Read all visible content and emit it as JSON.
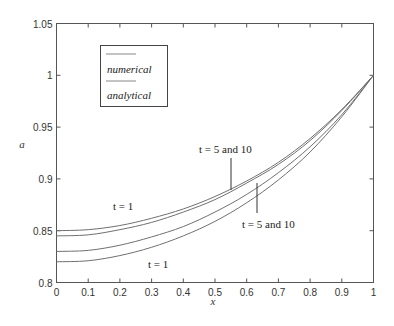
{
  "chart_data": {
    "type": "line",
    "title": "",
    "xlabel": "x",
    "ylabel": "a",
    "xlim": [
      0,
      1
    ],
    "ylim": [
      0.8,
      1.05
    ],
    "grid": false,
    "legend_position": "upper-left (inside)",
    "x_ticks": [
      "0",
      "0.1",
      "0.2",
      "0.3",
      "0.4",
      "0.5",
      "0.6",
      "0.7",
      "0.8",
      "0.9",
      "1"
    ],
    "y_ticks": [
      "0.8",
      "0.85",
      "0.9",
      "0.95",
      "1",
      "1.05"
    ],
    "legend": [
      {
        "label": "numerical"
      },
      {
        "label": "analytical"
      }
    ],
    "x": [
      0,
      0.1,
      0.2,
      0.3,
      0.4,
      0.5,
      0.6,
      0.7,
      0.8,
      0.9,
      1.0
    ],
    "series": [
      {
        "name": "t = 1 (upper)",
        "values": [
          0.85,
          0.851,
          0.855,
          0.862,
          0.871,
          0.883,
          0.898,
          0.916,
          0.939,
          0.967,
          1.0
        ]
      },
      {
        "name": "t = 5 and 10 (upper)",
        "values": [
          0.845,
          0.846,
          0.851,
          0.858,
          0.868,
          0.88,
          0.896,
          0.914,
          0.937,
          0.966,
          1.0
        ]
      },
      {
        "name": "t = 5 and 10 (lower)",
        "values": [
          0.83,
          0.831,
          0.836,
          0.844,
          0.854,
          0.868,
          0.885,
          0.906,
          0.931,
          0.962,
          1.0
        ]
      },
      {
        "name": "t = 1 (lower)",
        "values": [
          0.82,
          0.821,
          0.826,
          0.834,
          0.845,
          0.859,
          0.877,
          0.899,
          0.926,
          0.96,
          1.0
        ]
      }
    ],
    "annotations": [
      {
        "text": "t = 1",
        "near": "upper curve, x≈0.2"
      },
      {
        "text": "t = 5 and 10",
        "near": "upper pair, x≈0.55, pointer line"
      },
      {
        "text": "t = 5 and 10",
        "near": "lower pair, x≈0.63, pointer line"
      },
      {
        "text": "t = 1",
        "near": "lower curve, x≈0.3"
      }
    ]
  },
  "labels": {
    "xlabel": "x",
    "ylabel": "a",
    "legend_numerical": "numerical",
    "legend_analytical": "analytical",
    "annot_t1_upper": "t = 1",
    "annot_t510_upper": "t = 5 and 10",
    "annot_t510_lower": "t = 5 and 10",
    "annot_t1_lower": "t = 1"
  },
  "colors": {
    "curve": "#707070",
    "axis": "#555555"
  }
}
